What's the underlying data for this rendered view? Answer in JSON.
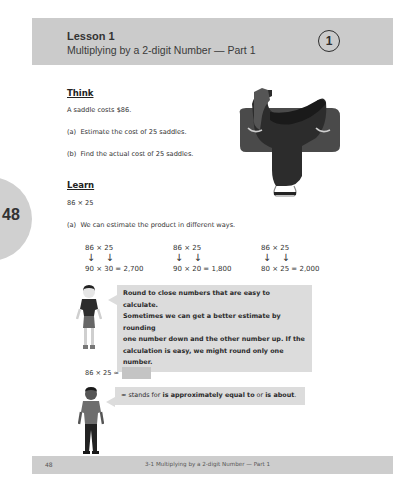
{
  "header": {
    "lesson_label": "Lesson 1",
    "lesson_title": "Multiplying by a 2-digit Number — Part 1",
    "lesson_number": "1"
  },
  "side_tab": {
    "page_number": "48"
  },
  "think": {
    "heading": "Think",
    "intro": "A saddle costs $86.",
    "items": [
      {
        "label": "(a)",
        "text": "Estimate the cost of 25 saddles."
      },
      {
        "label": "(b)",
        "text": "Find the actual cost of 25 saddles."
      }
    ],
    "image": "saddle-illustration"
  },
  "learn": {
    "heading": "Learn",
    "expression": "86 × 25",
    "part_a": {
      "label": "(a)",
      "text": "We can estimate the product in different ways."
    },
    "estimates": [
      {
        "original": "86 × 25",
        "arrows": "↓  ↓",
        "rounded": "90 × 30 = 2,700"
      },
      {
        "original": "86 × 25",
        "arrows": "↓  ↓",
        "rounded": "90 × 20 = 1,800"
      },
      {
        "original": "86 × 25",
        "arrows": "↓  ↓",
        "rounded": "80 × 25 = 2,000"
      }
    ],
    "girl_tip": [
      "Round to close numbers that are easy to calculate.",
      "Sometimes we can get a better estimate by rounding",
      "one number down and the other number up. If the",
      "calculation is easy, we might round only one number."
    ],
    "approx_expression": "86 × 25 ≈",
    "boy_tip": {
      "prefix": "≈ stands for ",
      "bold1": "is approximately equal to",
      "mid": " or ",
      "bold2": "is about",
      "suffix": "."
    }
  },
  "footer": {
    "page_number": "48",
    "text": "3-1  Multiplying by a 2-digit Number — Part 1"
  },
  "colors": {
    "header_band": "#cbcbcb",
    "bubble": "#dcdcdc",
    "answer_box": "#c4c4c4",
    "footer_band": "#cdcdcd"
  }
}
